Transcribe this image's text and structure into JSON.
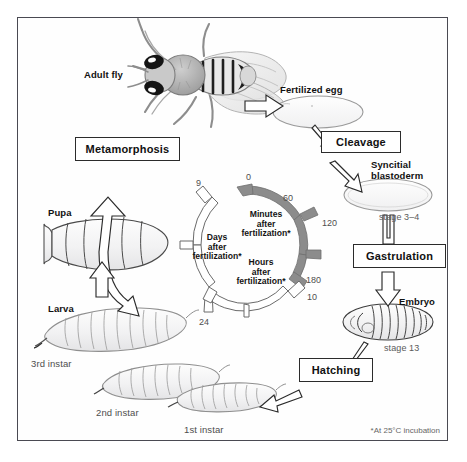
{
  "figure": {
    "footnote": "*At 25°C incubation",
    "background": "#ffffff",
    "frame_color": "#4a4a52"
  },
  "stages": [
    {
      "id": "adult-fly",
      "label": "Adult fly",
      "sub": ""
    },
    {
      "id": "fertilized-egg",
      "label": "Fertilized egg",
      "sub": ""
    },
    {
      "id": "syncytial-blastoderm",
      "label": "Syncitial\nblastoderm",
      "line1": "Syncitial",
      "line2": "blastoderm",
      "sub": "stage 3–4"
    },
    {
      "id": "embryo",
      "label": "Embryo",
      "sub": "stage 13"
    },
    {
      "id": "larva",
      "label": "Larva",
      "sub": ""
    },
    {
      "id": "larva-1st",
      "label": "1st instar",
      "sub": ""
    },
    {
      "id": "larva-2nd",
      "label": "2nd instar",
      "sub": ""
    },
    {
      "id": "larva-3rd",
      "label": "3rd instar",
      "sub": ""
    },
    {
      "id": "pupa",
      "label": "Pupa",
      "sub": ""
    }
  ],
  "transitions": [
    {
      "id": "metamorphosis",
      "label": "Metamorphosis"
    },
    {
      "id": "cleavage",
      "label": "Cleavage"
    },
    {
      "id": "gastrulation",
      "label": "Gastrulation"
    },
    {
      "id": "hatching",
      "label": "Hatching"
    }
  ],
  "timescales": [
    {
      "id": "minutes-arc",
      "name_line1": "Minutes",
      "name_line2": "after",
      "name_line3": "fertilization*",
      "unit": "minutes",
      "color": "#8a8a8a",
      "ticks": [
        "0",
        "60",
        "120",
        "180"
      ]
    },
    {
      "id": "hours-arc",
      "name_line1": "Hours",
      "name_line2": "after",
      "name_line3": "fertilization*",
      "unit": "hours",
      "color": "#ffffff",
      "ticks": [
        "10",
        "24"
      ]
    },
    {
      "id": "days-arc",
      "name_line1": "Days",
      "name_line2": "after",
      "name_line3": "fertilization*",
      "unit": "days",
      "color": "#ffffff",
      "ticks": [
        "9"
      ]
    }
  ]
}
